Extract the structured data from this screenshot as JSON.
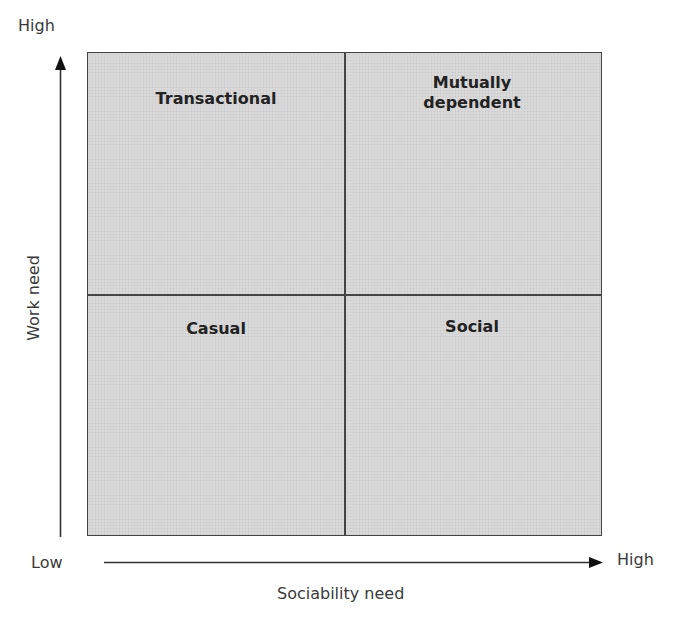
{
  "diagram": {
    "type": "2x2 matrix",
    "y_axis": {
      "label": "Work need",
      "low": "Low",
      "high": "High"
    },
    "x_axis": {
      "label": "Sociability need",
      "low": "Low",
      "high": "High"
    },
    "quadrants": {
      "top_left": "Transactional",
      "top_right": "Mutually dependent",
      "bottom_left": "Casual",
      "bottom_right": "Social"
    },
    "colors": {
      "quadrant_fill": "#d6d6d6",
      "lines": "#444444",
      "text": "#222222"
    }
  }
}
